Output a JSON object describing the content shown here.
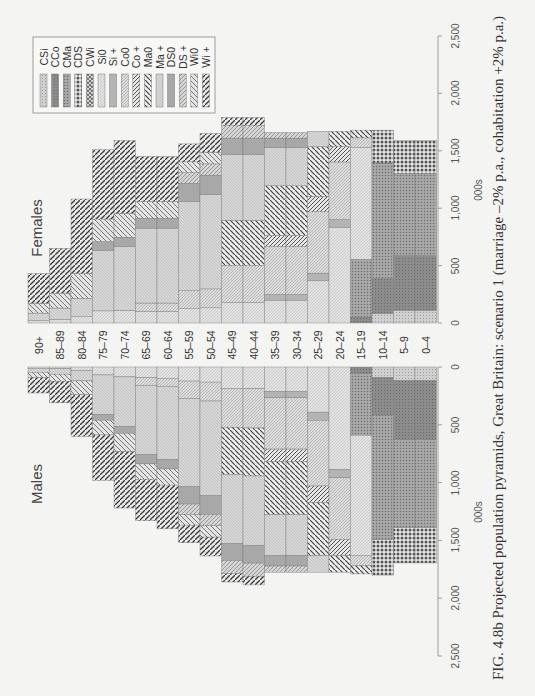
{
  "chart_data": {
    "type": "bar",
    "orientation": "population pyramid (rotated page; bars vertical)",
    "title": "Projected population pyramids, Great Britain: scenario 1 (marriage –2% p.a., cohabitation +2% p.a.)",
    "caption_prefix": "FIG. 4.8b",
    "xlabel": "000s",
    "ylabel": "Age group",
    "xlim": [
      0,
      2500
    ],
    "ticks": [
      "0",
      "500",
      "1,000",
      "1,500",
      "2,000",
      "2,500"
    ],
    "tick_values": [
      0,
      500,
      1000,
      1500,
      2000,
      2500
    ],
    "categories": [
      "90+",
      "85–89",
      "80–84",
      "75–79",
      "70–74",
      "65–69",
      "60–64",
      "55–59",
      "50–54",
      "45–49",
      "40–44",
      "35–39",
      "30–34",
      "25–29",
      "20–24",
      "15–19",
      "10–14",
      "5–9",
      "0–4"
    ],
    "series": [
      {
        "name": "Females",
        "values": [
          430,
          650,
          1080,
          1510,
          1590,
          1450,
          1450,
          1560,
          1650,
          1790,
          1790,
          1660,
          1660,
          1670,
          1670,
          1680,
          1680,
          1590,
          1590
        ]
      },
      {
        "name": "Males",
        "values": [
          225,
          310,
          600,
          980,
          1220,
          1330,
          1400,
          1520,
          1635,
          1860,
          1885,
          1775,
          1775,
          1775,
          1775,
          1790,
          1800,
          1695,
          1695
        ]
      }
    ],
    "legend": [
      "CSi",
      "CCo",
      "CMa",
      "CDS",
      "CWi",
      "Si0",
      "Si +",
      "Co0",
      "Co +",
      "Ma0",
      "Ma +",
      "DS0",
      "DS +",
      "Wi0",
      "Wi +"
    ],
    "legend_position": "top-left inside plot",
    "grid": false
  },
  "labels": {
    "females": "Females",
    "males": "Males",
    "unit": "000s",
    "caption": "FIG. 4.8b  Projected population pyramids, Great Britain: scenario 1 (marriage –2% p.a., cohabitation +2% p.a.)"
  }
}
